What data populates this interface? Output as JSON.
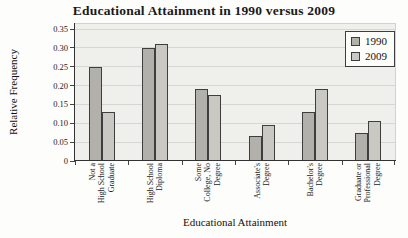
{
  "chart_data": {
    "type": "bar",
    "title": "Educational Attainment in 1990 versus 2009",
    "xlabel": "Educational Attainment",
    "ylabel": "Relative Frequency",
    "ylim": [
      0,
      0.35
    ],
    "ytick_step": 0.05,
    "ytick_labels": [
      "0",
      "0.05",
      "0.10",
      "0.15",
      "0.20",
      "0.25",
      "0.30",
      "0.35"
    ],
    "grid": true,
    "legend_position": "top-right",
    "categories": [
      "Not a High School Graduate",
      "High School Diploma",
      "Some College, No Degree",
      "Associate's Degree",
      "Bachelor's Degree",
      "Graduate or Professional Degree"
    ],
    "category_lines": [
      [
        "Not a",
        "High School",
        "Graduate"
      ],
      [
        "High School",
        "Diploma"
      ],
      [
        "Some",
        "College, No",
        "Degree"
      ],
      [
        "Associate's",
        "Degree"
      ],
      [
        "Bachelor's",
        "Degree"
      ],
      [
        "Graduate or",
        "Professional",
        "Degree"
      ]
    ],
    "series": [
      {
        "name": "1990",
        "color": "#b1b0ab",
        "values": [
          0.25,
          0.3,
          0.19,
          0.065,
          0.13,
          0.075
        ]
      },
      {
        "name": "2009",
        "color": "#c9c8c3",
        "values": [
          0.13,
          0.31,
          0.175,
          0.095,
          0.19,
          0.105
        ]
      }
    ],
    "colors": {
      "plot_background": "#efefec",
      "gridline": "#d6d6d2",
      "axis": "#333333",
      "bar_border": "#3e3e3e",
      "legend_background": "#fdfdfa"
    }
  }
}
